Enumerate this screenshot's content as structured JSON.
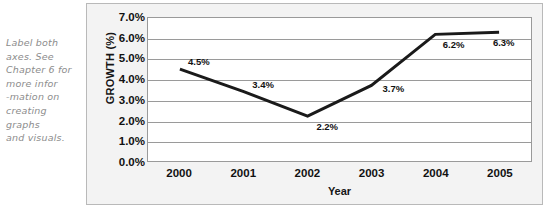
{
  "annotation": {
    "name": "margin-note",
    "lines": [
      "Label both",
      "axes. See",
      "Chapter 6 for",
      "more infor",
      "-mation on",
      "creating",
      "graphs",
      "and visuals."
    ]
  },
  "colors": {
    "line": "#1a1a1a",
    "gridline": "#9a9a9a",
    "plot_background": "#ffffff",
    "frame_background": "#f3f3f3",
    "frame_border": "#b9b9b9",
    "text": "#111111",
    "annotation_text": "#8c8c8c"
  },
  "chart_data": {
    "type": "line",
    "title": "",
    "xlabel": "Year",
    "ylabel": "GROWTH (%)",
    "categories": [
      "2000",
      "2001",
      "2002",
      "2003",
      "2004",
      "2005"
    ],
    "values": [
      4.5,
      3.4,
      2.2,
      3.7,
      6.2,
      6.3
    ],
    "data_labels": [
      "4.5%",
      "3.4%",
      "2.2%",
      "3.7%",
      "6.2%",
      "6.3%"
    ],
    "ylim": [
      0.0,
      7.0
    ],
    "ytick_values": [
      7.0,
      6.0,
      5.0,
      4.0,
      3.0,
      2.0,
      1.0,
      0.0
    ],
    "ytick_labels": [
      "7.0%",
      "6.0%",
      "5.0%",
      "4.0%",
      "3.0%",
      "2.0%",
      "1.0%",
      "0.0%"
    ],
    "grid": true,
    "grid_axis": "y",
    "legend": false,
    "markers": false,
    "line_width": 3
  }
}
